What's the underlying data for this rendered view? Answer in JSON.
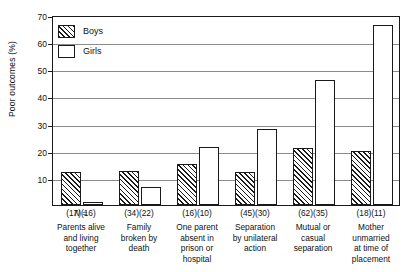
{
  "chart_data": {
    "type": "bar",
    "title": "",
    "xlabel": "",
    "ylabel": "Poor outcomes (%)",
    "ylim": [
      0,
      70
    ],
    "yticks": [
      0,
      10,
      20,
      30,
      40,
      50,
      60,
      70
    ],
    "ytick_labels": [
      "",
      "10",
      "20",
      "30",
      "40",
      "50",
      "60",
      "70"
    ],
    "grid": true,
    "legend_position": "top-left",
    "categories": [
      "Parents alive and living together",
      "Family broken by death",
      "One parent absent in prison or hospital",
      "Separation by unilateral action",
      "Mutual or casual separation",
      "Mother unmarried at time of placement"
    ],
    "category_lines": [
      [
        "Parents alive",
        "and living",
        "together"
      ],
      [
        "Family",
        "broken by",
        "death"
      ],
      [
        "One parent",
        "absent in",
        "prison or",
        "hospital"
      ],
      [
        "Separation",
        "by unilateral",
        "action"
      ],
      [
        "Mutual or",
        "casual",
        "separation"
      ],
      [
        "Mother",
        "unmarried",
        "at time of",
        "placement"
      ]
    ],
    "series": [
      {
        "name": "Boys",
        "values": [
          12,
          12.5,
          15,
          12,
          21,
          20
        ]
      },
      {
        "name": "Girls",
        "values": [
          1,
          6.5,
          21.5,
          28,
          46,
          66.5
        ]
      }
    ],
    "n_prefix": "N =",
    "n_labels": [
      "(17)(16)",
      "(34)(22)",
      "(16)(10)",
      "(45)(30)",
      "(62)(35)",
      "(18)(11)"
    ],
    "sample_sizes": {
      "boys": [
        17,
        34,
        16,
        45,
        62,
        18
      ],
      "girls": [
        16,
        22,
        10,
        30,
        35,
        11
      ]
    }
  },
  "legend": {
    "items": [
      {
        "label": "Boys",
        "pattern": "diagonal-hatch"
      },
      {
        "label": "Girls",
        "pattern": "empty"
      }
    ]
  },
  "colors": {
    "axis": "#1a1a1a",
    "grid": "#8b8b8b",
    "bar_fill": "#ffffff",
    "hatch": "#1a1a1a",
    "background": "#ffffff"
  }
}
